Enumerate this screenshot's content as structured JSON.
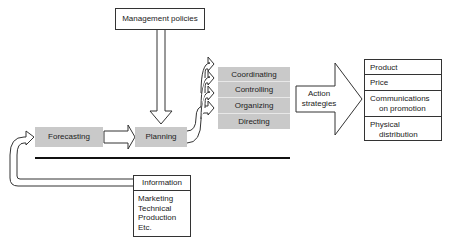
{
  "diagram": {
    "management_policies": "Management policies",
    "forecasting": "Forecasting",
    "planning": "Planning",
    "functions": [
      "Coordinating",
      "Controlling",
      "Organizing",
      "Directing"
    ],
    "action_strategies": [
      "Action",
      "strategies"
    ],
    "marketing_mix": [
      {
        "lines": [
          "Product"
        ]
      },
      {
        "lines": [
          "Price"
        ]
      },
      {
        "lines": [
          "Communications",
          "on promotion"
        ]
      },
      {
        "lines": [
          "Physical",
          "distribution"
        ]
      }
    ],
    "information": {
      "title": "Information",
      "items": [
        "Marketing",
        "Technical",
        "Production",
        "Etc."
      ]
    },
    "colors": {
      "box_fill": "#c9c9c9",
      "line": "#333333"
    }
  }
}
